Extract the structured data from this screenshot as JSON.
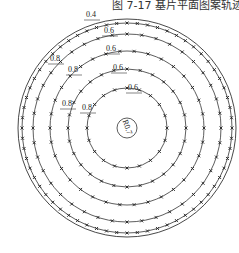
{
  "caption": "图 7-17  基片平面图案轨迹",
  "center": {
    "x": 127,
    "y": 128
  },
  "outer_boundary_radius": 109,
  "rings": [
    {
      "r": 105,
      "marks": 64
    },
    {
      "r": 94,
      "marks": 40
    },
    {
      "r": 77,
      "marks": 34
    },
    {
      "r": 59,
      "marks": 28
    },
    {
      "r": 40,
      "marks": 20
    }
  ],
  "inner_circle": {
    "r": 10,
    "label": "R0.7"
  },
  "dimensions": [
    {
      "label": "0.4",
      "x": 86,
      "y": 17
    },
    {
      "label": "0.6",
      "x": 104,
      "y": 33
    },
    {
      "label": "0.6",
      "x": 106,
      "y": 51
    },
    {
      "label": "0.6",
      "x": 113,
      "y": 70
    },
    {
      "label": "0.6",
      "x": 128,
      "y": 90
    },
    {
      "label": "0.8",
      "x": 50,
      "y": 61
    },
    {
      "label": "0.8",
      "x": 68,
      "y": 72
    },
    {
      "label": "0.8",
      "x": 62,
      "y": 106
    },
    {
      "label": "0.8",
      "x": 82,
      "y": 110
    }
  ],
  "colors": {
    "line": "#333333",
    "mark": "#222222"
  }
}
